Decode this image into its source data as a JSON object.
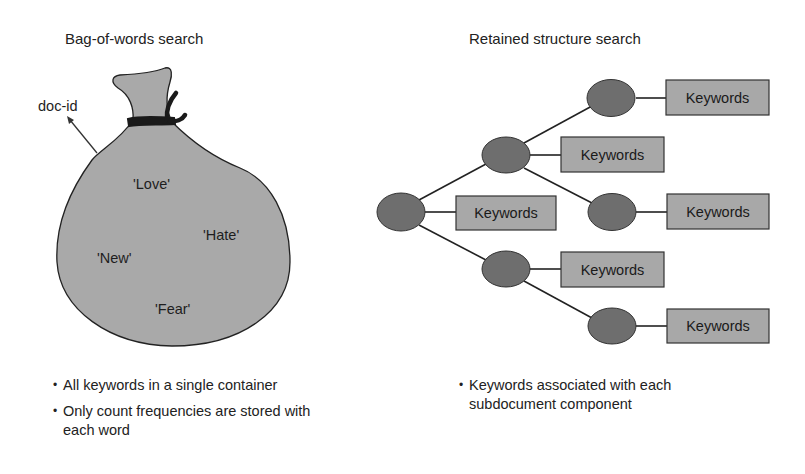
{
  "left_panel": {
    "title": "Bag-of-words search",
    "doc_id_label": "doc-id",
    "bag_words": [
      "'Love'",
      "'Hate'",
      "'New'",
      "'Fear'"
    ],
    "bullets": [
      "All keywords in a single container",
      "Only count frequencies are stored with each word"
    ]
  },
  "right_panel": {
    "title": "Retained structure search",
    "node_label": "Keywords",
    "keyword_boxes": [
      "Keywords",
      "Keywords",
      "Keywords",
      "Keywords",
      "Keywords",
      "Keywords"
    ],
    "bullets": [
      "Keywords associated with each subdocument component"
    ]
  },
  "colors": {
    "bag_fill": "#a9a9a9",
    "node_fill": "#6e6e6e",
    "box_fill": "#a8a8a8",
    "stroke": "#222222",
    "tie": "#1a1a1a"
  }
}
